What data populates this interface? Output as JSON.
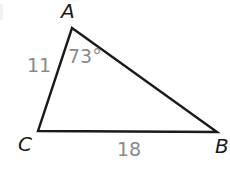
{
  "figure": {
    "type": "triangle-diagram",
    "background_color": "#ffffff",
    "stroke_color": "#1a1a1a",
    "vertex_label_color": "#1a1a1a",
    "measure_label_color": "#8a8a8e",
    "vertices": [
      {
        "name": "A",
        "label": "A",
        "x": 72,
        "y": 28
      },
      {
        "name": "B",
        "label": "B",
        "x": 217,
        "y": 132
      },
      {
        "name": "C",
        "label": "C",
        "x": 38,
        "y": 131
      }
    ],
    "sides": [
      {
        "name": "AC",
        "label": "11",
        "from": "A",
        "to": "C"
      },
      {
        "name": "CB",
        "label": "18",
        "from": "C",
        "to": "B"
      },
      {
        "name": "AB",
        "label": "",
        "from": "A",
        "to": "B"
      }
    ],
    "angles": [
      {
        "at": "A",
        "label": "73°",
        "value": 73,
        "unit": "degrees"
      }
    ],
    "stroke_width": 2.4
  }
}
